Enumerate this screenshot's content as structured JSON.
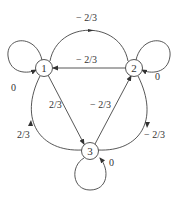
{
  "diagram": {
    "type": "directed-graph",
    "nodes": [
      {
        "id": "1",
        "label": "1"
      },
      {
        "id": "2",
        "label": "2"
      },
      {
        "id": "3",
        "label": "3"
      }
    ],
    "edges": [
      {
        "from": "1",
        "to": "1",
        "label": "0"
      },
      {
        "from": "2",
        "to": "2",
        "label": "0"
      },
      {
        "from": "3",
        "to": "3",
        "label": "0"
      },
      {
        "from": "1",
        "to": "2",
        "label": "− 2/3"
      },
      {
        "from": "2",
        "to": "1",
        "label": "− 2/3"
      },
      {
        "from": "1",
        "to": "3",
        "label": "2/3"
      },
      {
        "from": "3",
        "to": "2",
        "label": "− 2/3"
      },
      {
        "from": "3",
        "to": "1",
        "label": "2/3"
      },
      {
        "from": "2",
        "to": "3",
        "label": "− 2/3"
      }
    ]
  }
}
